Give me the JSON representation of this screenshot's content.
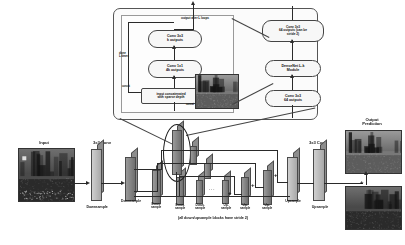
{
  "figure": {
    "type": "neural-network-architecture-diagram"
  },
  "detail_panel": {
    "output_label": "output after L loops",
    "loop_label": "done\nL times",
    "concat_left_label": "concat",
    "concat_bottom_label": "concat",
    "blocks": [
      {
        "id": "conv3x3-k",
        "label": "Conv 3x3\nk outputs"
      },
      {
        "id": "conv1x1-4k",
        "label": "Conv 1x1\n4k outputs"
      },
      {
        "id": "input-concat",
        "label": "input concatenated\nwith sparse depth"
      }
    ]
  },
  "right_column": {
    "blocks": [
      {
        "id": "conv3x3-64-stride",
        "label": "Conv 3x3\n64 outputs (can be\nstride 2)"
      },
      {
        "id": "densenet-module",
        "label": "DenseNet L-k\nModule"
      },
      {
        "id": "conv3x3-64",
        "label": "Conv 3x3\n64 outputs"
      }
    ]
  },
  "pipeline": {
    "input_label": "Input",
    "output_label": "Output\nPrediction",
    "conv_left_label": "3x3 Conv",
    "conv_right_label": "3x3 Conv",
    "footnote": "(all down/upsample blocks have stride 2)",
    "ellipsis": "...",
    "plus_symbol": "+",
    "blocks": [
      {
        "id": "conv-left",
        "label": ""
      },
      {
        "id": "down-1",
        "label": "Downsample"
      },
      {
        "id": "down-2",
        "label": "Down-\nsample"
      },
      {
        "id": "down-3",
        "label": "Down-\nsample"
      },
      {
        "id": "down-4",
        "label": "Down-\nsample"
      },
      {
        "id": "up-1",
        "label": "Up-\nsample"
      },
      {
        "id": "up-2",
        "label": "Up-\nsample"
      },
      {
        "id": "up-3",
        "label": "Up-\nsample"
      },
      {
        "id": "up-4",
        "label": "Upsample"
      },
      {
        "id": "conv-right",
        "label": "Upsample"
      }
    ],
    "left_conv_caption": "Downsample"
  },
  "colors": {
    "block_fill": "#b4b4b4",
    "block_stroke": "#4a4a4a",
    "line": "#2a2a2a",
    "panel_border": "#555555",
    "text": "#1a1a1a"
  }
}
